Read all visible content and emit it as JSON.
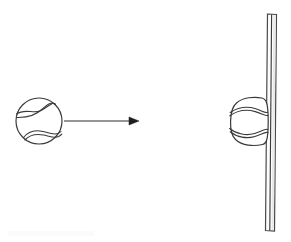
{
  "figure": {
    "background_color": "#ffffff",
    "line_color": "#3a3a3a",
    "width": 291,
    "height": 242
  },
  "ball_incoming": {
    "label": "ball before impact",
    "shape": "circle",
    "center_x": 39,
    "center_y": 121,
    "radius": 23,
    "fill_color": "#ffffff",
    "stroke_color": "#3a3a3a",
    "seam_count": 2
  },
  "motion_arrow": {
    "label": "velocity arrow",
    "direction": "right",
    "start_x": 64,
    "end_x": 139,
    "y": 121,
    "color": "#2e2e2e",
    "head_length": 9,
    "head_width": 8
  },
  "ball_compressed": {
    "label": "ball at impact (deformed)",
    "shape": "flattened-circle",
    "center_x": 248,
    "center_y": 121,
    "radius_x": 19,
    "radius_y": 24,
    "flat_side": "right",
    "fill_color": "#ffffff",
    "stroke_color": "#3a3a3a",
    "seam_count": 2
  },
  "wall": {
    "label": "wall",
    "orientation": "vertical",
    "top_x": 269,
    "bottom_x": 266,
    "top_y": 14,
    "bottom_y": 231,
    "thickness": 9,
    "fill_color": "#fdfdfd",
    "stroke_color": "#4a4a4a",
    "shade_color": "#e9e9e9"
  },
  "caption": {
    "text": ""
  }
}
